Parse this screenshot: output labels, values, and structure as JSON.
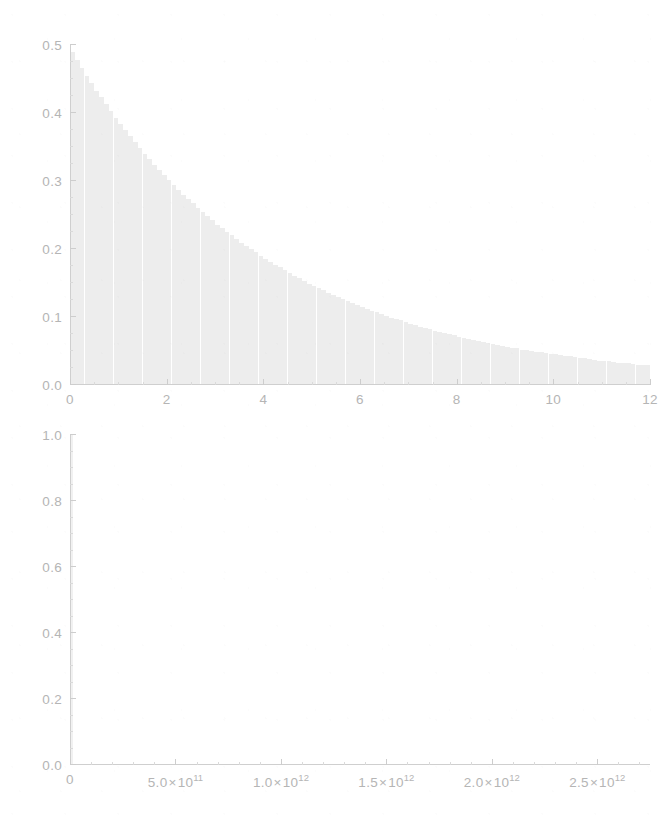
{
  "figure": {
    "background_color": "#ffffff",
    "ink_color": "#b5b5b5",
    "fill_color": "#ededed",
    "axis_color": "#cfcfcf",
    "panel_count": 2
  },
  "chart_data": [
    {
      "id": "top-panel",
      "type": "bar",
      "title": "",
      "xlabel": "",
      "ylabel": "",
      "xlim": [
        0,
        12
      ],
      "ylim": [
        0.0,
        0.5
      ],
      "grid": false,
      "legend": null,
      "x_ticks": [
        0,
        2,
        4,
        6,
        8,
        10,
        12
      ],
      "x_tick_labels": [
        "0",
        "2",
        "4",
        "6",
        "8",
        "10",
        "12"
      ],
      "x_minor_tick_interval": 0.5,
      "y_ticks": [
        0.0,
        0.1,
        0.2,
        0.3,
        0.4,
        0.5
      ],
      "y_tick_labels": [
        "0.0",
        "0.1",
        "0.2",
        "0.3",
        "0.4",
        "0.5"
      ],
      "y_minor_tick_interval": 0.025,
      "description": "Exponential-decay histogram peaking near the origin",
      "bin_width": 0.1,
      "x": [
        0.05,
        0.15,
        0.25,
        0.35,
        0.45,
        0.55,
        0.65,
        0.75,
        0.85,
        0.95,
        1.05,
        1.15,
        1.25,
        1.35,
        1.45,
        1.55,
        1.65,
        1.75,
        1.85,
        1.95,
        2.05,
        2.15,
        2.25,
        2.35,
        2.45,
        2.55,
        2.65,
        2.75,
        2.85,
        2.95,
        3.05,
        3.15,
        3.25,
        3.35,
        3.45,
        3.55,
        3.65,
        3.75,
        3.85,
        3.95,
        4.05,
        4.15,
        4.25,
        4.35,
        4.45,
        4.55,
        4.65,
        4.75,
        4.85,
        4.95,
        5.05,
        5.15,
        5.25,
        5.35,
        5.45,
        5.55,
        5.65,
        5.75,
        5.85,
        5.95,
        6.05,
        6.15,
        6.25,
        6.35,
        6.45,
        6.55,
        6.65,
        6.75,
        6.85,
        6.95,
        7.05,
        7.15,
        7.25,
        7.35,
        7.45,
        7.55,
        7.65,
        7.75,
        7.85,
        7.95,
        8.05,
        8.15,
        8.25,
        8.35,
        8.45,
        8.55,
        8.65,
        8.75,
        8.85,
        8.95,
        9.05,
        9.15,
        9.25,
        9.35,
        9.45,
        9.55,
        9.65,
        9.75,
        9.85,
        9.95,
        10.05,
        10.15,
        10.25,
        10.35,
        10.45,
        10.55,
        10.65,
        10.75,
        10.85,
        10.95,
        11.05,
        11.15,
        11.25,
        11.35,
        11.45,
        11.55,
        11.65,
        11.75,
        11.85,
        11.95
      ],
      "values": [
        0.489,
        0.478,
        0.466,
        0.455,
        0.444,
        0.433,
        0.423,
        0.413,
        0.403,
        0.393,
        0.384,
        0.375,
        0.366,
        0.357,
        0.348,
        0.34,
        0.332,
        0.324,
        0.316,
        0.309,
        0.301,
        0.294,
        0.287,
        0.28,
        0.273,
        0.267,
        0.26,
        0.254,
        0.248,
        0.242,
        0.236,
        0.231,
        0.225,
        0.22,
        0.215,
        0.209,
        0.204,
        0.2,
        0.195,
        0.19,
        0.186,
        0.181,
        0.177,
        0.173,
        0.169,
        0.165,
        0.161,
        0.157,
        0.153,
        0.149,
        0.146,
        0.142,
        0.139,
        0.136,
        0.132,
        0.129,
        0.126,
        0.123,
        0.12,
        0.117,
        0.115,
        0.112,
        0.109,
        0.107,
        0.104,
        0.102,
        0.099,
        0.097,
        0.095,
        0.092,
        0.09,
        0.088,
        0.086,
        0.084,
        0.082,
        0.08,
        0.078,
        0.076,
        0.075,
        0.073,
        0.071,
        0.069,
        0.068,
        0.066,
        0.065,
        0.063,
        0.062,
        0.06,
        0.059,
        0.058,
        0.056,
        0.055,
        0.054,
        0.052,
        0.051,
        0.05,
        0.049,
        0.048,
        0.047,
        0.046,
        0.045,
        0.044,
        0.043,
        0.042,
        0.041,
        0.04,
        0.039,
        0.038,
        0.037,
        0.036,
        0.036,
        0.035,
        0.034,
        0.033,
        0.032,
        0.032,
        0.031,
        0.03,
        0.03,
        0.029
      ]
    },
    {
      "id": "bottom-panel",
      "type": "bar",
      "title": "",
      "xlabel": "",
      "ylabel": "",
      "xlim": [
        0,
        2750000000000
      ],
      "ylim": [
        0.0,
        1.0
      ],
      "grid": false,
      "legend": null,
      "x_ticks": [
        0,
        500000000000,
        1000000000000,
        1500000000000,
        2000000000000,
        2500000000000
      ],
      "x_tick_labels": [
        {
          "mantissa": "0",
          "times": "",
          "base": "",
          "exp": ""
        },
        {
          "mantissa": "5.0",
          "times": "×",
          "base": "10",
          "exp": "11"
        },
        {
          "mantissa": "1.0",
          "times": "×",
          "base": "10",
          "exp": "12"
        },
        {
          "mantissa": "1.5",
          "times": "×",
          "base": "10",
          "exp": "12"
        },
        {
          "mantissa": "2.0",
          "times": "×",
          "base": "10",
          "exp": "12"
        },
        {
          "mantissa": "2.5",
          "times": "×",
          "base": "10",
          "exp": "12"
        }
      ],
      "x_minor_tick_interval": 100000000000,
      "y_ticks": [
        0.0,
        0.2,
        0.4,
        0.6,
        0.8,
        1.0
      ],
      "y_tick_labels": [
        "0.0",
        "0.2",
        "0.4",
        "0.6",
        "0.8",
        "1.0"
      ],
      "y_minor_tick_interval": 0.05,
      "description": "Single narrow spike at the origin reaching full height; remainder of the range is empty",
      "x": [
        0
      ],
      "values": [
        1.0
      ]
    }
  ]
}
